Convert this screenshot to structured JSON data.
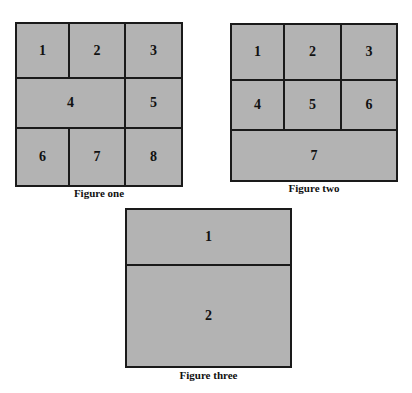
{
  "colors": {
    "cell_fill": "#b3b3b3",
    "border": "#1a1a1a",
    "text": "#111111",
    "background": "#ffffff"
  },
  "figures": [
    {
      "caption": "Figure one",
      "cells": [
        "1",
        "2",
        "3",
        "4",
        "5",
        "6",
        "7",
        "8"
      ]
    },
    {
      "caption": "Figure two",
      "cells": [
        "1",
        "2",
        "3",
        "4",
        "5",
        "6",
        "7"
      ]
    },
    {
      "caption": "Figure three",
      "cells": [
        "1",
        "2"
      ]
    }
  ]
}
